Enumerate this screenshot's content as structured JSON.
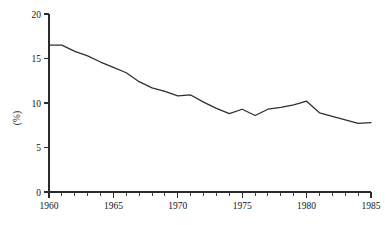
{
  "chart_data": {
    "type": "line",
    "title": "",
    "subtitle": "",
    "xlabel": "",
    "ylabel": "(%)",
    "xlim": [
      1960,
      1985
    ],
    "ylim": [
      0,
      20
    ],
    "grid": false,
    "legend": null,
    "x_tick_labels": [
      "1960",
      "1965",
      "1970",
      "1975",
      "1980",
      "1985"
    ],
    "x_major_ticks": [
      1960,
      1965,
      1970,
      1975,
      1980,
      1985
    ],
    "x_minor_tick_step": 1,
    "y_tick_labels": [
      "0",
      "5",
      "10",
      "15",
      "20"
    ],
    "y_major_ticks": [
      0,
      5,
      10,
      15,
      20
    ],
    "series": [
      {
        "name": "share",
        "color": "#2f2f2f",
        "x": [
          1960,
          1961,
          1962,
          1963,
          1964,
          1965,
          1966,
          1967,
          1968,
          1969,
          1970,
          1971,
          1972,
          1973,
          1974,
          1975,
          1976,
          1977,
          1978,
          1979,
          1980,
          1981,
          1982,
          1983,
          1984,
          1985
        ],
        "values": [
          16.5,
          16.5,
          15.8,
          15.3,
          14.6,
          14.0,
          13.4,
          12.4,
          11.7,
          11.3,
          10.8,
          10.9,
          10.1,
          9.4,
          8.8,
          9.3,
          8.6,
          9.3,
          9.5,
          9.8,
          10.2,
          8.9,
          8.5,
          8.1,
          7.7,
          7.8
        ]
      }
    ],
    "x_tick_label_positions": [
      1960,
      1965,
      1970,
      1975,
      1980,
      1985
    ]
  },
  "axes": {
    "y_axis_name": "y-axis",
    "x_axis_name": "x-axis"
  }
}
